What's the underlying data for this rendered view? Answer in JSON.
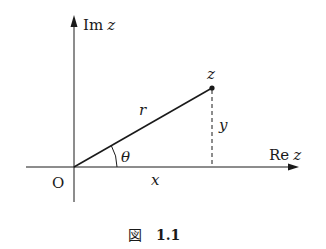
{
  "figure": {
    "caption_prefix": "図",
    "caption_number": "1.1",
    "axes": {
      "horizontal_label_main": "Re",
      "horizontal_label_var": "z",
      "vertical_label_main": "Im",
      "vertical_label_var": "z",
      "origin_label": "O"
    },
    "point": {
      "label": "z"
    },
    "segments": {
      "radius_label": "r",
      "imag_part_label": "y",
      "real_part_label": "x",
      "angle_label": "θ"
    },
    "colors": {
      "stroke": "#1a1a1a",
      "background": "#ffffff"
    }
  }
}
